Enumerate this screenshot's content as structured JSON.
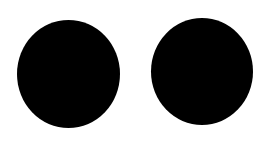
{
  "canvas": {
    "background": "#ffffff",
    "width": 271,
    "height": 149
  },
  "shapes": [
    {
      "type": "circle",
      "color": "#000000",
      "label": "left-circle"
    },
    {
      "type": "circle",
      "color": "#000000",
      "label": "right-circle"
    }
  ]
}
